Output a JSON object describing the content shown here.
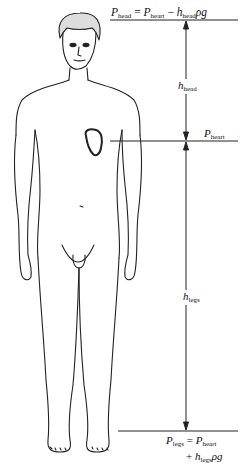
{
  "diagram": {
    "type": "hydrostatic-pressure-human-body",
    "labels": {
      "head_equation": {
        "lhs": "P",
        "lhs_sub": "head",
        "eq": "=",
        "t1": "P",
        "t1_sub": "heart",
        "op": "−",
        "t2": "h",
        "t2_sub": "head",
        "t2_tail": "ρg"
      },
      "h_head": {
        "sym": "h",
        "sub": "head"
      },
      "p_heart": {
        "sym": "P",
        "sub": "heart"
      },
      "h_legs": {
        "sym": "h",
        "sub": "legs"
      },
      "legs_equation": {
        "lhs": "P",
        "lhs_sub": "legs",
        "eq": "=",
        "t1": "P",
        "t1_sub": "heart",
        "op": "+",
        "t2": "h",
        "t2_sub": "legs",
        "t2_tail": "ρg"
      }
    },
    "levels": {
      "head_y": 20,
      "heart_y": 141,
      "feet_y": 431
    },
    "colors": {
      "line": "#222222",
      "background": "#ffffff"
    }
  }
}
